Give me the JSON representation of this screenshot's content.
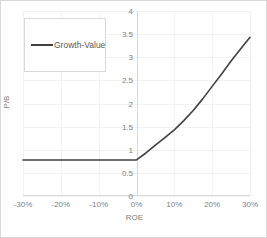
{
  "chart_data": {
    "type": "line",
    "title": "",
    "xlabel": "ROE",
    "ylabel": "P/B",
    "xlim": [
      -0.3,
      0.3
    ],
    "ylim": [
      0,
      4
    ],
    "grid": true,
    "legend_position": "top-left",
    "x_tick_labels": [
      "-30%",
      "-20%",
      "-10%",
      "0%",
      "10%",
      "20%",
      "30%"
    ],
    "x_tick_values": [
      -0.3,
      -0.2,
      -0.1,
      0.0,
      0.1,
      0.2,
      0.3
    ],
    "y_tick_labels": [
      "0",
      "0.5",
      "1",
      "1.5",
      "2",
      "2.5",
      "3",
      "3.5",
      "4"
    ],
    "y_tick_values": [
      0,
      0.5,
      1,
      1.5,
      2,
      2.5,
      3,
      3.5,
      4
    ],
    "series": [
      {
        "name": "Growth-Value",
        "color": "#404040",
        "x": [
          -0.3,
          -0.25,
          -0.2,
          -0.15,
          -0.1,
          -0.05,
          0.0,
          0.025,
          0.05,
          0.075,
          0.1,
          0.125,
          0.15,
          0.175,
          0.2,
          0.225,
          0.25,
          0.275,
          0.3
        ],
        "values": [
          0.78,
          0.78,
          0.78,
          0.78,
          0.78,
          0.78,
          0.78,
          0.93,
          1.1,
          1.26,
          1.43,
          1.63,
          1.85,
          2.1,
          2.37,
          2.64,
          2.92,
          3.18,
          3.43
        ]
      }
    ]
  },
  "legend": {
    "items": [
      {
        "label": "Growth-Value",
        "color": "#404040"
      }
    ]
  },
  "axes": {
    "x": {
      "title": "ROE",
      "ticks": [
        "-30%",
        "-20%",
        "-10%",
        "0%",
        "10%",
        "20%",
        "30%"
      ]
    },
    "y": {
      "title": "P/B",
      "ticks": [
        "4",
        "3.5",
        "3",
        "2.5",
        "2",
        "1.5",
        "1",
        "0.5",
        "0"
      ]
    }
  },
  "colors": {
    "series_line": "#404040",
    "gridline": "#f2f2f2",
    "axis_line": "#d9d9d9",
    "tick_text": "#808080",
    "frame_border": "#d9d9d9",
    "background": "#ffffff"
  }
}
